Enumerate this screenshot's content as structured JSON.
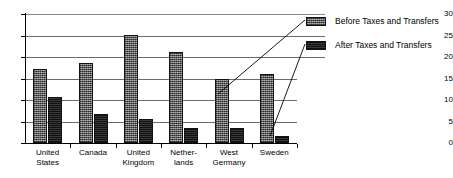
{
  "chart_data": {
    "type": "bar",
    "title": "",
    "subtitle": "",
    "xlabel": "",
    "ylabel": "",
    "ylim": [
      0,
      30
    ],
    "ytick_values": [
      0,
      5,
      10,
      15,
      20,
      25,
      30
    ],
    "ytick_labels": [
      "0",
      "5",
      "10",
      "15",
      "20",
      "25",
      "30"
    ],
    "grid": "horizontal",
    "legend_position": "right",
    "categories": [
      "United\nStates",
      "Canada",
      "United\nKingdom",
      "Nether-\nlands",
      "West\nGermany",
      "Sweden"
    ],
    "category_labels_flat": [
      "United States",
      "Canada",
      "United Kingdom",
      "Netherlands",
      "West Germany",
      "Sweden"
    ],
    "series": [
      {
        "name": "Before Taxes and Transfers",
        "values": [
          17.3,
          18.6,
          25.2,
          21.2,
          14.8,
          16.0
        ],
        "color": "#6e6e6e",
        "pattern": "stippled-gray"
      },
      {
        "name": "After Taxes and Transfers",
        "values": [
          10.8,
          6.7,
          5.7,
          3.5,
          3.5,
          1.7
        ],
        "color": "#232323",
        "pattern": "solid-dark"
      }
    ],
    "annotations": [
      {
        "name": "leader-line-before",
        "from_legend_series": "Before Taxes and Transfers",
        "to_category": "West Germany",
        "to_series": "Before Taxes and Transfers"
      },
      {
        "name": "leader-line-after",
        "from_legend_series": "After Taxes and Transfers",
        "to_category": "Sweden",
        "to_series": "After Taxes and Transfers"
      }
    ]
  },
  "legend": {
    "items": [
      {
        "label": "Before Taxes and Transfers"
      },
      {
        "label": "After Taxes and Transfers"
      }
    ]
  },
  "axis": {
    "y_labels": [
      "30",
      "25",
      "20",
      "15",
      "10",
      "5",
      "0"
    ]
  }
}
